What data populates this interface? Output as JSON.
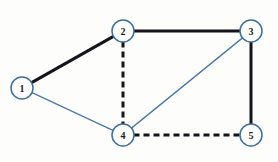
{
  "diagram": {
    "type": "undirected-graph",
    "canvas": {
      "width": 278,
      "height": 162,
      "background": "#fdfdfc"
    },
    "style": {
      "node_fill": "#ffffff",
      "node_stroke": "#3d6f9e",
      "node_stroke_width": 1.5,
      "node_radius": 11,
      "label_color": "#1d1d22",
      "thick_edge_color": "#14141a",
      "thick_edge_width": 3,
      "thin_edge_color": "#4a7aa8",
      "thin_edge_width": 1.3,
      "dash_pattern": "6,4"
    },
    "nodes": [
      {
        "id": "1",
        "label": "1",
        "x": 22,
        "y": 88
      },
      {
        "id": "2",
        "label": "2",
        "x": 123,
        "y": 31
      },
      {
        "id": "3",
        "label": "3",
        "x": 251,
        "y": 31
      },
      {
        "id": "4",
        "label": "4",
        "x": 123,
        "y": 135
      },
      {
        "id": "5",
        "label": "5",
        "x": 251,
        "y": 135
      }
    ],
    "edges": [
      {
        "id": "e12",
        "from": "1",
        "to": "2",
        "weight_style": "thick",
        "line": "solid"
      },
      {
        "id": "e23",
        "from": "2",
        "to": "3",
        "weight_style": "thick",
        "line": "solid"
      },
      {
        "id": "e35",
        "from": "3",
        "to": "5",
        "weight_style": "thick",
        "line": "solid"
      },
      {
        "id": "e24",
        "from": "2",
        "to": "4",
        "weight_style": "thick",
        "line": "dashed"
      },
      {
        "id": "e45",
        "from": "4",
        "to": "5",
        "weight_style": "thick",
        "line": "dashed"
      },
      {
        "id": "e14",
        "from": "1",
        "to": "4",
        "weight_style": "thin",
        "line": "solid"
      },
      {
        "id": "e34",
        "from": "3",
        "to": "4",
        "weight_style": "thin",
        "line": "solid"
      }
    ]
  }
}
